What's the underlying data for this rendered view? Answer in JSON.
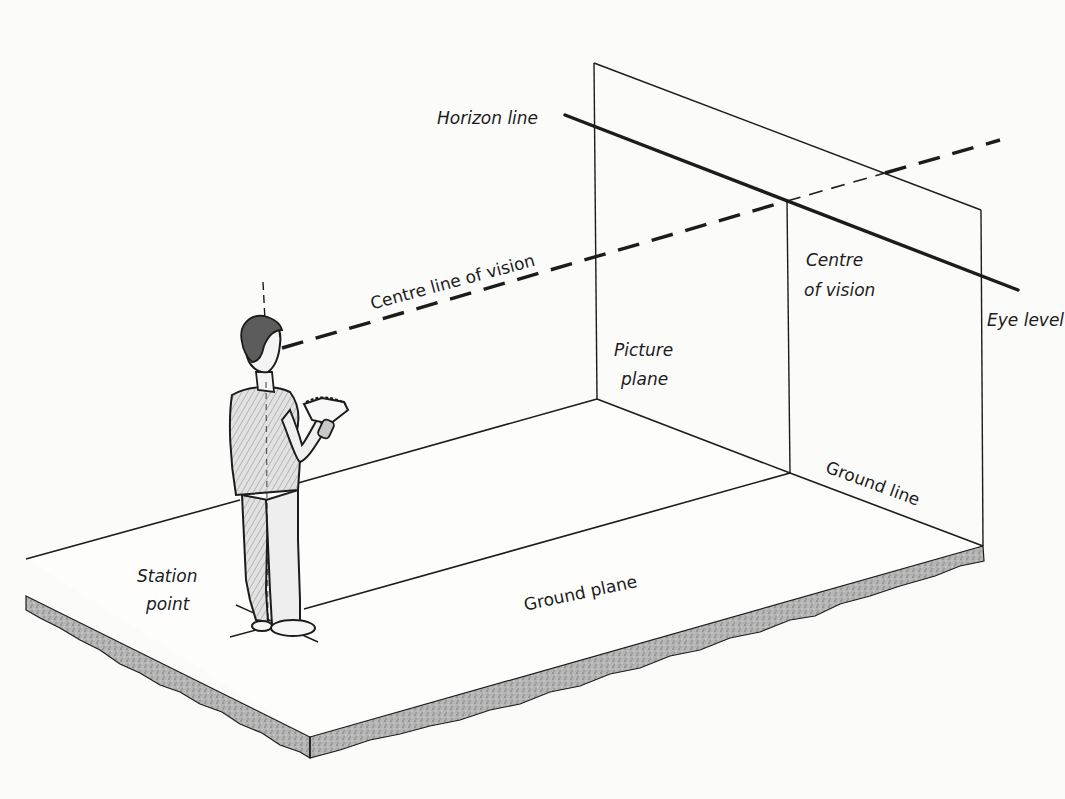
{
  "diagram": {
    "colors": {
      "background": "#fbfbfa",
      "ink": "#1c1c1c",
      "slab_texture": "#a8a8a8",
      "shirt_shading": "#b9b9b9"
    },
    "labels": {
      "horizon_line": "Horizon line",
      "centre_line_of_vision": "Centre line of vision",
      "centre_of_vision_1": "Centre",
      "centre_of_vision_2": "of vision",
      "eye_level": "Eye level",
      "picture_plane_1": "Picture",
      "picture_plane_2": "plane",
      "ground_line": "Ground line",
      "ground_plane": "Ground plane",
      "station_point_1": "Station",
      "station_point_2": "point"
    },
    "elements": [
      {
        "id": "picture-plane",
        "type": "vertical plane",
        "label": "Picture plane"
      },
      {
        "id": "horizon-line",
        "type": "solid thick line",
        "label": "Horizon line"
      },
      {
        "id": "centre-line-of-vision",
        "type": "dashed line",
        "label": "Centre line of vision"
      },
      {
        "id": "centre-of-vision",
        "type": "point",
        "label": "Centre of vision"
      },
      {
        "id": "ground-line",
        "type": "line",
        "label": "Ground line"
      },
      {
        "id": "ground-plane",
        "type": "horizontal slab",
        "label": "Ground plane"
      },
      {
        "id": "station-point",
        "type": "point",
        "label": "Station point"
      },
      {
        "id": "observer",
        "type": "figure",
        "label": "Observer holding sketchbook"
      },
      {
        "id": "eye-level",
        "type": "marker",
        "label": "Eye level"
      }
    ]
  }
}
